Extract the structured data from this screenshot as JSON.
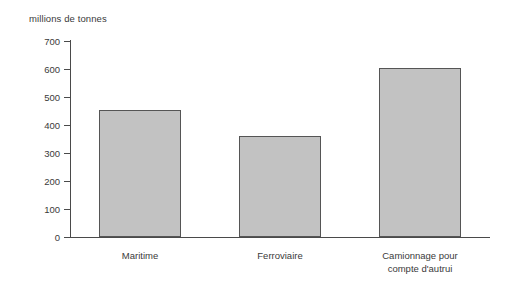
{
  "chart_data": {
    "type": "bar",
    "title": "",
    "subtitle": "",
    "axis_unit_title": "millions de tonnes",
    "xlabel": "",
    "ylabel": "millions de tonnes",
    "categories": [
      "Maritime",
      "Ferroviaire",
      "Camionnage pour compte d'autrui"
    ],
    "category_lines": [
      [
        "Maritime"
      ],
      [
        "Ferroviaire"
      ],
      [
        "Camionnage pour",
        "compte d'autrui"
      ]
    ],
    "values": [
      452,
      362,
      605
    ],
    "ylim": [
      0,
      700
    ],
    "ytick_values": [
      0,
      100,
      200,
      300,
      400,
      500,
      600,
      700
    ],
    "ytick_labels": [
      "0",
      "100",
      "200",
      "300",
      "400",
      "500",
      "600",
      "700"
    ],
    "grid": false,
    "legend": false,
    "legend_position": "none",
    "bar_fill_color": "#c2c2c2",
    "bar_border_color": "#555555",
    "axis_color": "#4a4a4a",
    "text_color": "#3a3a3a",
    "background_color": "#ffffff"
  }
}
